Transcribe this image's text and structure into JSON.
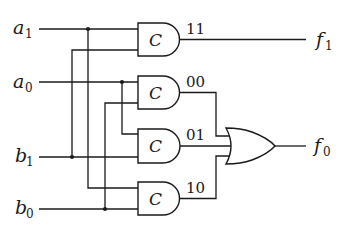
{
  "diagram": {
    "type": "logic-circuit",
    "colors": {
      "line": "#1a1a1a",
      "background": "#ffffff"
    },
    "inputs": [
      {
        "id": "a1",
        "name": "a",
        "sub": "1"
      },
      {
        "id": "a0",
        "name": "a",
        "sub": "0"
      },
      {
        "id": "b1",
        "name": "b",
        "sub": "1"
      },
      {
        "id": "b0",
        "name": "b",
        "sub": "0"
      }
    ],
    "outputs": [
      {
        "id": "f1",
        "name": "f",
        "sub": "1"
      },
      {
        "id": "f0",
        "name": "f",
        "sub": "0"
      }
    ],
    "comparator_gates": [
      {
        "id": "g11",
        "label": "C",
        "code": "11",
        "inputs": [
          "a1",
          "b1"
        ]
      },
      {
        "id": "g00",
        "label": "C",
        "code": "00",
        "inputs": [
          "a0",
          "b0"
        ]
      },
      {
        "id": "g01",
        "label": "C",
        "code": "01",
        "inputs": [
          "a0",
          "b1"
        ]
      },
      {
        "id": "g10",
        "label": "C",
        "code": "10",
        "inputs": [
          "a1",
          "b0"
        ]
      }
    ],
    "or_gate": {
      "id": "or",
      "inputs": [
        "g00",
        "g01",
        "g10"
      ],
      "output": "f0"
    }
  }
}
